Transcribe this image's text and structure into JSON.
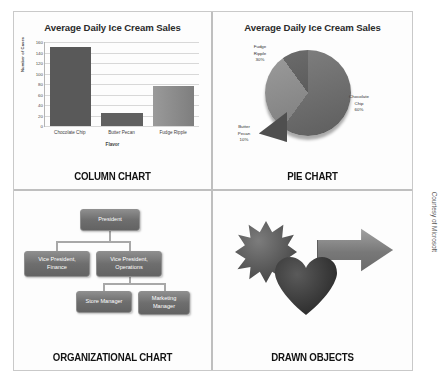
{
  "credit": "Courtesy of Microsoft",
  "panels": {
    "column": {
      "caption": "COLUMN CHART"
    },
    "pie": {
      "caption": "PIE CHART",
      "labels": {
        "fudge": "Fudge\nRipple\n30%",
        "chocolate": "Chocolate\nChip\n60%",
        "butter": "Butter\nPecan\n10%"
      }
    },
    "org": {
      "caption": "ORGANIZATIONAL CHART",
      "nodes": {
        "president": "President",
        "vp_finance": "Vice President,\nFinance",
        "vp_operations": "Vice President,\nOperations",
        "store_manager": "Store Manager",
        "marketing_manager": "Marketing\nManager"
      }
    },
    "drawn": {
      "caption": "DRAWN OBJECTS",
      "shapes": [
        "star-burst-shape",
        "right-arrow-shape",
        "heart-shape"
      ]
    }
  },
  "chart_data": [
    {
      "type": "bar",
      "title": "Average Daily Ice Cream Sales",
      "categories": [
        "Chocolate Chip",
        "Butter Pecan",
        "Fudge Ripple"
      ],
      "values": [
        150,
        25,
        77
      ],
      "xlabel": "Flavor",
      "ylabel": "Number of Cases",
      "ylim": [
        0,
        160
      ],
      "yticks": [
        160,
        140,
        120,
        100,
        80,
        60,
        40,
        20,
        0
      ],
      "grid": true,
      "legend": "none",
      "colors": [
        "#595959",
        "#606060",
        "#8a8a8a"
      ]
    },
    {
      "type": "pie",
      "title": "Average Daily Ice Cream Sales",
      "categories": [
        "Chocolate Chip",
        "Fudge Ripple",
        "Butter Pecan"
      ],
      "values": [
        60,
        30,
        10
      ],
      "value_unit": "%",
      "exploded": [
        "Butter Pecan"
      ],
      "legend": "none",
      "colors": [
        "#6f6f6f",
        "#8e8e8e",
        "#4f4f4f"
      ]
    }
  ]
}
